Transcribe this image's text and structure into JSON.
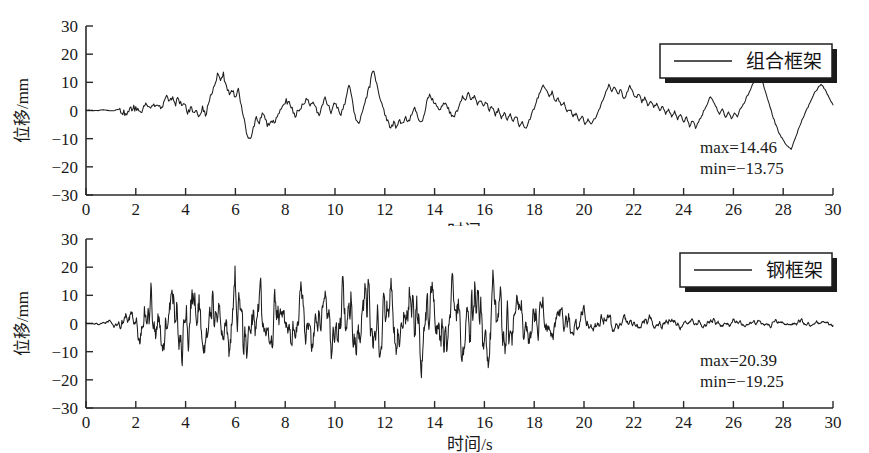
{
  "figure": {
    "background": "#ffffff",
    "line_color": "#1d1d1d",
    "axis_color": "#2a2a2a"
  },
  "chart_data": [
    {
      "type": "line",
      "title": "",
      "panel": "top",
      "series_name": "组合框架",
      "legend_label": "组合框架",
      "legend_position": "top-right",
      "xlabel": "时间/s",
      "ylabel": "位移/mm",
      "xlim": [
        0,
        30
      ],
      "ylim": [
        -30,
        30
      ],
      "xticks": [
        0,
        2,
        4,
        6,
        8,
        10,
        12,
        14,
        16,
        18,
        20,
        22,
        24,
        26,
        28,
        30
      ],
      "yticks": [
        -30,
        -20,
        -10,
        0,
        10,
        20,
        30
      ],
      "grid": false,
      "annotations": {
        "max_label": "max=14.46",
        "min_label": "min=−13.75",
        "max_value": 14.46,
        "min_value": -13.75
      },
      "x": [
        0.0,
        0.12,
        0.24,
        0.36,
        0.48,
        0.6,
        0.72,
        0.84,
        0.96,
        1.08,
        1.2,
        1.32,
        1.44,
        1.56,
        1.68,
        1.8,
        1.92,
        2.04,
        2.16,
        2.28,
        2.4,
        2.52,
        2.64,
        2.76,
        2.88,
        3.0,
        3.12,
        3.24,
        3.36,
        3.48,
        3.6,
        3.72,
        3.84,
        3.96,
        4.08,
        4.2,
        4.32,
        4.44,
        4.56,
        4.68,
        4.8,
        4.92,
        5.04,
        5.16,
        5.28,
        5.4,
        5.52,
        5.64,
        5.76,
        5.88,
        6.0,
        6.12,
        6.24,
        6.36,
        6.48,
        6.6,
        6.72,
        6.84,
        6.96,
        7.08,
        7.2,
        7.32,
        7.44,
        7.56,
        7.68,
        7.8,
        7.92,
        8.04,
        8.16,
        8.28,
        8.4,
        8.52,
        8.64,
        8.76,
        8.88,
        9.0,
        9.12,
        9.24,
        9.36,
        9.48,
        9.6,
        9.72,
        9.84,
        9.96,
        10.08,
        10.2,
        10.32,
        10.44,
        10.56,
        10.68,
        10.8,
        10.92,
        11.04,
        11.16,
        11.28,
        11.4,
        11.52,
        11.64,
        11.76,
        11.88,
        12.0,
        12.12,
        12.24,
        12.36,
        12.48,
        12.6,
        12.72,
        12.84,
        12.96,
        13.08,
        13.2,
        13.32,
        13.44,
        13.56,
        13.68,
        13.8,
        13.92,
        14.04,
        14.16,
        14.28,
        14.4,
        14.52,
        14.64,
        14.76,
        14.88,
        15.0,
        15.12,
        15.24,
        15.36,
        15.48,
        15.6,
        15.72,
        15.84,
        15.96,
        16.08,
        16.2,
        16.32,
        16.44,
        16.56,
        16.68,
        16.8,
        16.92,
        17.04,
        17.16,
        17.28,
        17.4,
        17.52,
        17.64,
        17.76,
        17.88,
        18.0,
        18.12,
        18.24,
        18.36,
        18.48,
        18.6,
        18.72,
        18.84,
        18.96,
        19.08,
        19.2,
        19.32,
        19.44,
        19.56,
        19.68,
        19.8,
        19.92,
        20.04,
        20.16,
        20.28,
        20.4,
        20.52,
        20.64,
        20.76,
        20.88,
        21.0,
        21.12,
        21.24,
        21.36,
        21.48,
        21.6,
        21.72,
        21.84,
        21.96,
        22.08,
        22.2,
        22.32,
        22.44,
        22.56,
        22.68,
        22.8,
        22.92,
        23.04,
        23.16,
        23.28,
        23.4,
        23.52,
        23.64,
        23.76,
        23.88,
        24.0,
        24.12,
        24.24,
        24.36,
        24.48,
        24.6,
        24.72,
        24.84,
        24.96,
        25.08,
        25.2,
        25.32,
        25.44,
        25.56,
        25.68,
        25.8,
        25.92,
        26.04,
        26.16,
        26.28,
        26.4,
        26.52,
        26.64,
        26.76,
        26.88,
        27.0,
        27.12,
        27.24,
        27.36,
        27.48,
        27.6,
        27.72,
        27.84,
        27.96,
        28.08,
        28.2,
        28.32,
        28.44,
        28.56,
        28.68,
        28.8,
        28.92,
        29.04,
        29.16,
        29.28,
        29.4,
        29.52,
        29.64,
        29.76,
        29.88,
        30.0
      ],
      "y": [
        0.0,
        0.1,
        0.0,
        -0.1,
        0.0,
        0.1,
        0.2,
        0.0,
        -0.2,
        -0.1,
        0.2,
        0.4,
        -0.3,
        -1.0,
        -0.6,
        0.3,
        0.9,
        0.4,
        -0.3,
        0.6,
        1.8,
        2.3,
        1.6,
        2.1,
        1.5,
        0.6,
        2.0,
        4.6,
        3.1,
        5.0,
        2.6,
        4.3,
        1.5,
        3.0,
        -1.5,
        1.2,
        -1.5,
        0.5,
        -2.2,
        1.0,
        -2.0,
        2.5,
        6.3,
        9.5,
        12.5,
        11.0,
        13.0,
        8.0,
        6.5,
        7.2,
        5.0,
        7.5,
        1.0,
        -4.0,
        -8.5,
        -10.5,
        -6.0,
        -2.0,
        -4.0,
        -1.0,
        -3.5,
        -5.5,
        -3.0,
        -5.0,
        -2.0,
        0.5,
        2.0,
        3.5,
        2.5,
        0.5,
        -1.5,
        -0.5,
        1.0,
        2.5,
        4.0,
        2.0,
        3.0,
        0.5,
        -1.5,
        2.0,
        5.0,
        2.0,
        -1.0,
        3.5,
        1.5,
        -2.0,
        0.5,
        4.0,
        9.0,
        4.0,
        -2.0,
        -5.0,
        -2.5,
        1.0,
        5.0,
        9.0,
        14.5,
        11.0,
        6.0,
        2.0,
        -1.0,
        -4.0,
        -6.5,
        -4.5,
        -6.0,
        -3.5,
        -5.0,
        -2.5,
        -4.0,
        -1.0,
        0.5,
        -2.0,
        -4.5,
        -2.0,
        3.0,
        5.5,
        4.0,
        2.0,
        0.5,
        1.5,
        3.0,
        1.0,
        -1.0,
        -2.5,
        -0.5,
        2.0,
        5.0,
        4.0,
        6.5,
        3.5,
        5.0,
        2.0,
        4.0,
        1.0,
        3.0,
        0.0,
        1.5,
        -1.5,
        0.5,
        -2.5,
        -0.5,
        -3.0,
        -1.0,
        -4.0,
        -2.0,
        -5.5,
        -4.0,
        -6.5,
        -4.5,
        -2.0,
        1.0,
        4.0,
        7.0,
        9.5,
        7.5,
        5.0,
        6.5,
        3.0,
        4.5,
        1.5,
        2.5,
        -0.5,
        0.5,
        -2.0,
        -1.0,
        -3.5,
        -2.0,
        -4.5,
        -3.0,
        -5.0,
        -3.5,
        -1.5,
        1.0,
        3.5,
        6.5,
        9.0,
        7.0,
        8.5,
        5.5,
        7.5,
        4.0,
        6.0,
        8.5,
        6.5,
        4.5,
        6.0,
        3.0,
        4.5,
        2.0,
        3.5,
        1.0,
        2.5,
        0.0,
        1.5,
        -1.0,
        0.5,
        -2.0,
        -0.5,
        -3.0,
        -1.5,
        -4.0,
        -2.5,
        -5.5,
        -3.5,
        -6.0,
        -4.0,
        -2.0,
        0.5,
        2.5,
        5.0,
        3.0,
        1.0,
        -1.5,
        0.5,
        -2.5,
        -0.5,
        -3.0,
        -1.0,
        -2.0,
        0.5,
        2.0,
        4.5,
        6.5,
        9.0,
        11.0,
        14.46,
        11.5,
        8.0,
        4.5,
        1.0,
        -2.5,
        -5.5,
        -8.0,
        -10.0,
        -11.5,
        -13.0,
        -13.75,
        -11.0,
        -8.0,
        -5.0,
        -2.5,
        0.0,
        2.0,
        4.5,
        6.5,
        8.0,
        9.5,
        8.0,
        6.0,
        4.0,
        2.0,
        0.5,
        -1.0,
        -2.5,
        -4.0,
        -3.0,
        -1.5,
        0.0,
        1.5,
        3.0,
        4.5,
        3.5,
        2.0,
        0.5,
        -1.0,
        -2.0,
        -3.0,
        -2.0,
        -1.0,
        0.0,
        1.0,
        2.0
      ]
    },
    {
      "type": "line",
      "title": "",
      "panel": "bottom",
      "series_name": "钢框架",
      "legend_label": "钢框架",
      "legend_position": "top-right",
      "xlabel": "时间/s",
      "ylabel": "位移/mm",
      "xlim": [
        0,
        30
      ],
      "ylim": [
        -30,
        30
      ],
      "xticks": [
        0,
        2,
        4,
        6,
        8,
        10,
        12,
        14,
        16,
        18,
        20,
        22,
        24,
        26,
        28,
        30
      ],
      "yticks": [
        -30,
        -20,
        -10,
        0,
        10,
        20,
        30
      ],
      "grid": false,
      "annotations": {
        "max_label": "max=20.39",
        "min_label": "min=−19.25",
        "max_value": 20.39,
        "min_value": -19.25
      }
    }
  ],
  "labels": {
    "y_axis_title": "位移/mm",
    "x_axis_title": "时间/s"
  },
  "ytick_labels": [
    "30",
    "20",
    "10",
    "0",
    "−10",
    "−20",
    "−30"
  ],
  "xtick_labels": [
    "0",
    "2",
    "4",
    "6",
    "8",
    "10",
    "12",
    "14",
    "16",
    "18",
    "20",
    "22",
    "24",
    "26",
    "28",
    "30"
  ]
}
